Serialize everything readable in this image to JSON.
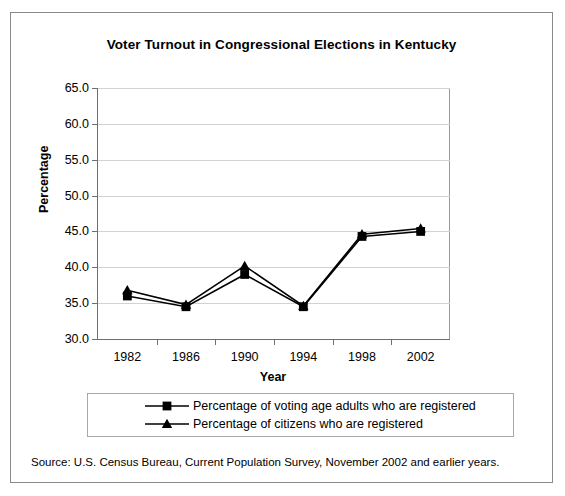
{
  "chart_data": {
    "type": "line",
    "title": "Voter Turnout in Congressional Elections in Kentucky",
    "xlabel": "Year",
    "ylabel": "Percentage",
    "categories": [
      "1982",
      "1986",
      "1990",
      "1994",
      "1998",
      "2002"
    ],
    "x": [
      1982,
      1986,
      1990,
      1994,
      1998,
      2002
    ],
    "ylim": [
      30.0,
      65.0
    ],
    "ytick_labels": [
      "30.0",
      "35.0",
      "40.0",
      "45.0",
      "50.0",
      "55.0",
      "60.0",
      "65.0"
    ],
    "ytick_values": [
      30.0,
      35.0,
      40.0,
      45.0,
      50.0,
      55.0,
      60.0,
      65.0
    ],
    "grid": true,
    "legend_position": "below",
    "series": [
      {
        "name": "Percentage of voting age adults who are registered",
        "marker": "square",
        "color": "#000000",
        "values": [
          36.0,
          34.5,
          39.0,
          34.5,
          44.3,
          45.0
        ]
      },
      {
        "name": "Percentage of citizens who are registered",
        "marker": "triangle",
        "color": "#000000",
        "values": [
          36.8,
          34.8,
          40.2,
          34.6,
          44.6,
          45.4
        ]
      }
    ]
  },
  "source": {
    "note": "Source: U.S. Census Bureau, Current Population Survey, November 2002 and earlier years."
  }
}
